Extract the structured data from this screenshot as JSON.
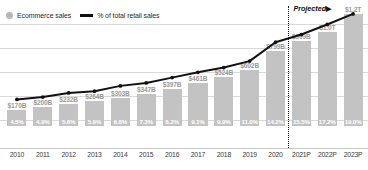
{
  "legend": {
    "items": [
      {
        "label": "Ecommerce sales",
        "marker": "circle-swatch-icon",
        "color": "#b7b7b7"
      },
      {
        "label": "% of total retail sales",
        "marker": "line-swatch-icon",
        "color": "#111111"
      }
    ]
  },
  "annotations": {
    "projected_label": "Projected",
    "projected_arrow": "▶"
  },
  "colors": {
    "bar": "#c3c3c3",
    "line": "#111111",
    "bar_value_text": "#9a9a9a",
    "pct_text": "#ffffff",
    "gridline": "#d9d9d9"
  },
  "chart_data": {
    "type": "bar",
    "title": "",
    "subtitle": "",
    "xlabel": "",
    "ylabel": "",
    "grid": true,
    "legend_position": "top-left",
    "categories": [
      "2010",
      "2011",
      "2012",
      "2013",
      "2014",
      "2015",
      "2016",
      "2017",
      "2018",
      "2019",
      "2020",
      "2021P",
      "2022P",
      "2023P"
    ],
    "series": [
      {
        "name": "Ecommerce sales",
        "type": "bar",
        "value_labels": [
          "$170B",
          "$200B",
          "$232B",
          "$264B",
          "$303B",
          "$347B",
          "$397B",
          "$461B",
          "$524B",
          "$602B",
          "$799B",
          "$909B",
          "$1.0T",
          "$1.2T"
        ],
        "values": [
          170,
          200,
          232,
          264,
          303,
          347,
          397,
          461,
          524,
          602,
          799,
          909,
          1000,
          1200
        ],
        "unit": "USD billions",
        "ylim": [
          0,
          1260
        ]
      },
      {
        "name": "% of total retail sales",
        "type": "line",
        "value_labels": [
          "4.5%",
          "4.9%",
          "5.6%",
          "5.9%",
          "6.8%",
          "7.3%",
          "8.2%",
          "9.1%",
          "9.9%",
          "11.0%",
          "14.2%",
          "15.5%",
          "17.2%",
          "19.0%"
        ],
        "values": [
          4.5,
          4.9,
          5.6,
          5.9,
          6.8,
          7.3,
          8.2,
          9.1,
          9.9,
          11.0,
          14.2,
          15.5,
          17.2,
          19.0
        ],
        "unit": "percent",
        "ylim": [
          0,
          20
        ]
      }
    ],
    "projection_starts_at": "2021P"
  }
}
